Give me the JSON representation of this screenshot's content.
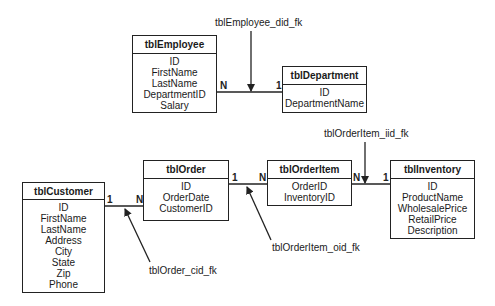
{
  "diagram": {
    "type": "entity-relationship",
    "tables": [
      {
        "id": "tblEmployee",
        "name": "tblEmployee",
        "fields": [
          "ID",
          "FirstName",
          "LastName",
          "DepartmentID",
          "Salary"
        ]
      },
      {
        "id": "tblDepartment",
        "name": "tblDepartment",
        "fields": [
          "ID",
          "DepartmentName"
        ]
      },
      {
        "id": "tblCustomer",
        "name": "tblCustomer",
        "fields": [
          "ID",
          "FirstName",
          "LastName",
          "Address",
          "City",
          "State",
          "Zip",
          "Phone"
        ]
      },
      {
        "id": "tblOrder",
        "name": "tblOrder",
        "fields": [
          "ID",
          "OrderDate",
          "CustomerID"
        ]
      },
      {
        "id": "tblOrderItem",
        "name": "tblOrderItem",
        "fields": [
          "OrderID",
          "InventoryID"
        ]
      },
      {
        "id": "tblInventory",
        "name": "tblInventory",
        "fields": [
          "ID",
          "ProductName",
          "WholesalePrice",
          "RetailPrice",
          "Description"
        ]
      }
    ],
    "relationships": [
      {
        "name": "tblEmployee_did_fk",
        "from": "tblEmployee",
        "from_card": "N",
        "to": "tblDepartment",
        "to_card": "1"
      },
      {
        "name": "tblOrder_cid_fk",
        "from": "tblCustomer",
        "from_card": "1",
        "to": "tblOrder",
        "to_card": "N"
      },
      {
        "name": "tblOrderItem_oid_fk",
        "from": "tblOrder",
        "from_card": "1",
        "to": "tblOrderItem",
        "to_card": "N"
      },
      {
        "name": "tblOrderItem_iid_fk",
        "from": "tblOrderItem",
        "from_card": "N",
        "to": "tblInventory",
        "to_card": "1"
      }
    ]
  },
  "labels": {
    "employee_fk": "tblEmployee_did_fk",
    "order_cid_fk": "tblOrder_cid_fk",
    "orderitem_oid_fk": "tblOrderItem_oid_fk",
    "orderitem_iid_fk": "tblOrderItem_iid_fk"
  },
  "cardinality": {
    "emp_dept_n": "N",
    "emp_dept_1": "1",
    "cust_order_1": "1",
    "cust_order_n": "N",
    "order_item_1": "1",
    "order_item_n": "N",
    "item_inv_n": "N",
    "item_inv_1": "1"
  },
  "colors": {
    "line": "#222222",
    "background": "#ffffff"
  }
}
